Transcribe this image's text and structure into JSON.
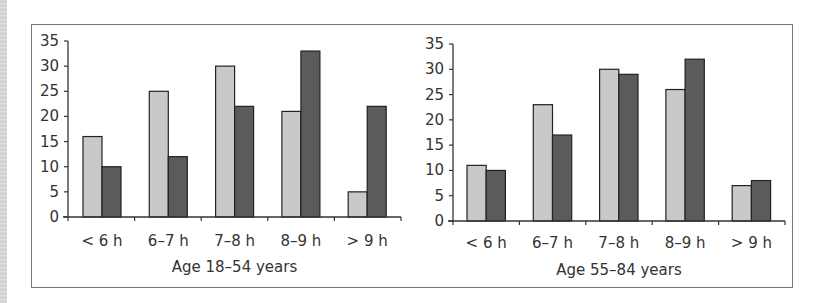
{
  "figure": {
    "panels": [
      {
        "title": "Age 18–54 years"
      },
      {
        "title": "Age 55–84 years"
      }
    ]
  },
  "colors": {
    "series_a": "#c9c9c9",
    "series_b": "#5b5b5b",
    "bar_border": "#222222",
    "axis": "#333333"
  },
  "chart_data": [
    {
      "type": "bar",
      "title": "",
      "xlabel": "Age 18–54 years",
      "ylabel": "",
      "categories": [
        "< 6 h",
        "6–7 h",
        "7–8 h",
        "8–9 h",
        "> 9 h"
      ],
      "series": [
        {
          "name": "light",
          "color": "#c9c9c9",
          "values": [
            16,
            25,
            30,
            21,
            5
          ]
        },
        {
          "name": "dark",
          "color": "#5b5b5b",
          "values": [
            10,
            12,
            22,
            33,
            22
          ]
        }
      ],
      "yticks": [
        0,
        5,
        10,
        15,
        20,
        25,
        30,
        35
      ],
      "ylim": [
        0,
        35
      ],
      "grid": false,
      "legend": "none"
    },
    {
      "type": "bar",
      "title": "",
      "xlabel": "Age 55–84 years",
      "ylabel": "",
      "categories": [
        "< 6 h",
        "6–7 h",
        "7–8 h",
        "8–9 h",
        "> 9 h"
      ],
      "series": [
        {
          "name": "light",
          "color": "#c9c9c9",
          "values": [
            11,
            23,
            30,
            26,
            7
          ]
        },
        {
          "name": "dark",
          "color": "#5b5b5b",
          "values": [
            10,
            17,
            29,
            32,
            8
          ]
        }
      ],
      "yticks": [
        0,
        5,
        10,
        15,
        20,
        25,
        30,
        35
      ],
      "ylim": [
        0,
        35
      ],
      "grid": false,
      "legend": "none"
    }
  ]
}
